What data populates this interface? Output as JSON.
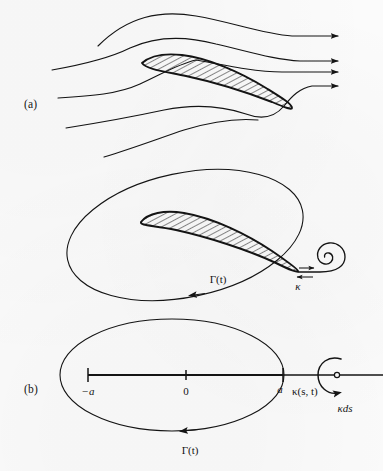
{
  "figure": {
    "background_color": "#fbfbfb",
    "ink_color": "#141414",
    "panels": [
      {
        "id": "a",
        "label": "(a)",
        "description": "Aerofoil in steady streaming flow with streamlines and flow-direction arrows",
        "streamline_count": 5,
        "arrow_count": 4,
        "airfoil_hatched": true
      },
      {
        "id": "b",
        "label": "(b)",
        "description": "Aerofoil enclosed by material circuit with starting vortex shed at trailing edge",
        "circuit_label": "Γ(t)",
        "vortex_label": "κ",
        "airfoil_hatched": true,
        "spiral_turns": 2.6
      },
      {
        "id": "c",
        "label": "(c)",
        "description": "Flat-plate vortex-sheet model on the real axis from -a to a with element of circulation",
        "circuit_label": "Γ(t)",
        "axis_ticks": [
          "−a",
          "0",
          "a"
        ],
        "sheet_label": "κ(s, t)",
        "element_label": "κds"
      }
    ]
  },
  "labels": {
    "panel_a": "(a)",
    "panel_b": "(b)",
    "panel_c": "(c)",
    "gamma_b": "Γ(t)",
    "kappa_b": "κ",
    "gamma_c": "Γ(t)",
    "tick_minus_a": "−a",
    "tick_zero": "0",
    "tick_a": "a",
    "kappa_st": "κ(s, t)",
    "kappa_ds": "κds"
  }
}
